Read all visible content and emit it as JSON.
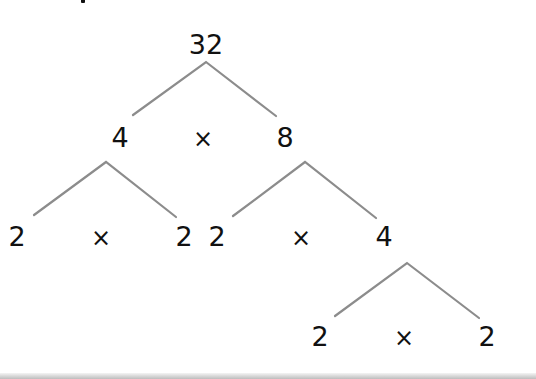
{
  "diagram": {
    "type": "factor-tree",
    "line_color": "#8c8c8c",
    "text_color": "#111111",
    "root": "32",
    "level1": {
      "left": "4",
      "op": "×",
      "right": "8"
    },
    "level2_left": {
      "left": "2",
      "op": "×",
      "right": "2"
    },
    "level2_right": {
      "left": "2",
      "op": "×",
      "right": "4"
    },
    "level3": {
      "left": "2",
      "op": "×",
      "right": "2"
    }
  }
}
